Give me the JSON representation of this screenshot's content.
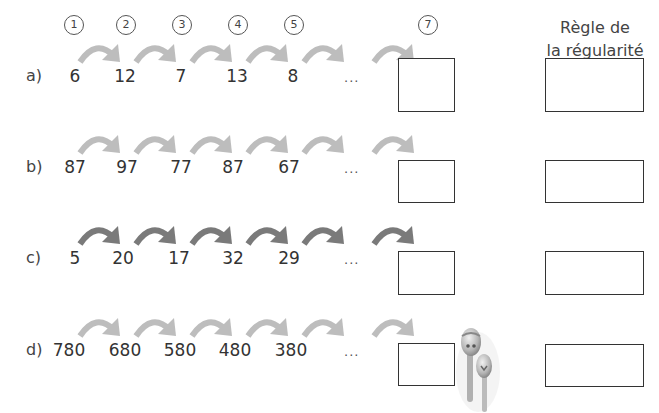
{
  "header": {
    "step_numbers": [
      "1",
      "2",
      "3",
      "4",
      "5",
      "7"
    ],
    "rule_title_line1": "Règle de",
    "rule_title_line2": "la régularité"
  },
  "colors": {
    "arrow_light": "#bdbdbd",
    "arrow_dark": "#7a7a7a",
    "box_border": "#333333"
  },
  "rows": [
    {
      "label": "a)",
      "values": [
        "6",
        "12",
        "7",
        "13",
        "8"
      ],
      "ellipsis": "...",
      "arrow_style": "light"
    },
    {
      "label": "b)",
      "values": [
        "87",
        "97",
        "77",
        "87",
        "67"
      ],
      "ellipsis": "...",
      "arrow_style": "light"
    },
    {
      "label": "c)",
      "values": [
        "5",
        "20",
        "17",
        "32",
        "29"
      ],
      "ellipsis": "...",
      "arrow_style": "dark"
    },
    {
      "label": "d)",
      "values": [
        "780",
        "680",
        "580",
        "480",
        "380"
      ],
      "ellipsis": "...",
      "arrow_style": "light"
    }
  ]
}
